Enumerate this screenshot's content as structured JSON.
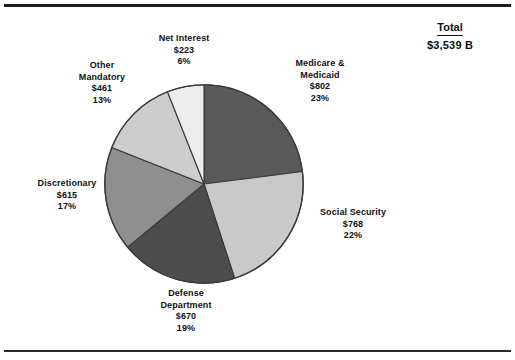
{
  "chart_data": {
    "type": "pie",
    "title": "",
    "subtitle": "",
    "xlabel": "",
    "ylabel": "",
    "legend_position": "none",
    "grid": false,
    "units": "billions of dollars",
    "total_label": "Total",
    "total_value": "$3,539 B",
    "total_amount": 3539,
    "categories": [
      "Medicare & Medicaid",
      "Social Security",
      "Defense Department",
      "Discretionary",
      "Other Mandatory",
      "Net Interest"
    ],
    "values": [
      802,
      768,
      670,
      615,
      461,
      223
    ],
    "percents": [
      23,
      22,
      19,
      17,
      13,
      6
    ],
    "colors": [
      "#595959",
      "#c9c9c9",
      "#4d4d4d",
      "#8f8f8f",
      "#cdcdcd",
      "#ececec"
    ],
    "start_angle_deg": 0,
    "direction": "clockwise",
    "slices": [
      {
        "name": "Medicare & Medicaid",
        "line1": "Medicare &",
        "line2": "Medicaid",
        "value_label": "$802",
        "percent_label": "23%",
        "value": 802,
        "percent": 23,
        "color": "#595959"
      },
      {
        "name": "Social Security",
        "line1": "Social Security",
        "line2": "",
        "value_label": "$768",
        "percent_label": "22%",
        "value": 768,
        "percent": 22,
        "color": "#c9c9c9"
      },
      {
        "name": "Defense Department",
        "line1": "Defense",
        "line2": "Department",
        "value_label": "$670",
        "percent_label": "19%",
        "value": 670,
        "percent": 19,
        "color": "#4d4d4d"
      },
      {
        "name": "Discretionary",
        "line1": "Discretionary",
        "line2": "",
        "value_label": "$615",
        "percent_label": "17%",
        "value": 615,
        "percent": 17,
        "color": "#8f8f8f"
      },
      {
        "name": "Other Mandatory",
        "line1": "Other",
        "line2": "Mandatory",
        "value_label": "$461",
        "percent_label": "13%",
        "value": 461,
        "percent": 13,
        "color": "#cdcdcd"
      },
      {
        "name": "Net Interest",
        "line1": "Net Interest",
        "line2": "",
        "value_label": "$223",
        "percent_label": "6%",
        "value": 223,
        "percent": 6,
        "color": "#ececec"
      }
    ]
  }
}
